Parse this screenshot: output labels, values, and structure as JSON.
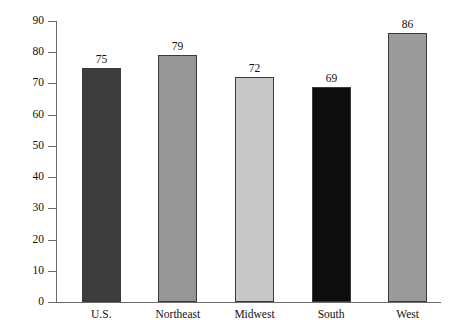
{
  "chart_data": {
    "type": "bar",
    "title": "",
    "xlabel": "",
    "ylabel": "",
    "categories": [
      "U.S.",
      "Northeast",
      "Midwest",
      "South",
      "West"
    ],
    "values": [
      75,
      79,
      72,
      69,
      86
    ],
    "value_labels": [
      "75",
      "79",
      "72",
      "69",
      "86"
    ],
    "bar_colors": [
      "#3d3d3d",
      "#969696",
      "#c8c8c8",
      "#0d0d0d",
      "#9b9b9b"
    ],
    "bar_border_color": "#3a3a3a",
    "ylim": [
      0,
      90
    ],
    "ytick_step": 10,
    "ytick_labels": [
      "0",
      "10",
      "20",
      "30",
      "40",
      "50",
      "60",
      "70",
      "80",
      "90"
    ],
    "ytick_values": [
      0,
      10,
      20,
      30,
      40,
      50,
      60,
      70,
      80,
      90
    ],
    "grid": false,
    "legend": "none",
    "axis_color": "#6b6b6b",
    "background": "#ffffff"
  },
  "title_strip": {
    "text": "",
    "note": "clipped at top edge"
  }
}
